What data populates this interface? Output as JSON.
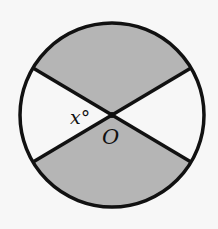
{
  "diagram": {
    "type": "circle-with-diameters",
    "center": {
      "x": 112,
      "y": 115
    },
    "radius": 92,
    "shade_color": "#b5b5b5",
    "line_color": "#111111",
    "background": "#f7f7f7",
    "labels": {
      "angle": "x°",
      "center": "O"
    },
    "shaded_sectors": [
      "top",
      "bottom"
    ],
    "endpoints": {
      "upper_left": {
        "x": 33,
        "y": 68
      },
      "upper_right": {
        "x": 191,
        "y": 68
      },
      "lower_left": {
        "x": 33,
        "y": 162
      },
      "lower_right": {
        "x": 191,
        "y": 162
      }
    }
  }
}
